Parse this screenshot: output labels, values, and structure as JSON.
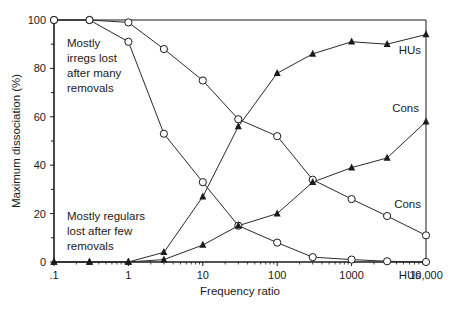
{
  "chart_data": {
    "type": "line",
    "title": "",
    "xlabel": "Frequency ratio",
    "ylabel": "Maximum dissociation (%)",
    "xscale": "log",
    "xlim": [
      0.1,
      10000
    ],
    "ylim": [
      0,
      100
    ],
    "grid": false,
    "x_ticks": [
      {
        "value": 0.1,
        "label": ".1"
      },
      {
        "value": 1,
        "label": "1"
      },
      {
        "value": 10,
        "label": "10"
      },
      {
        "value": 100,
        "label": "100"
      },
      {
        "value": 1000,
        "label": "1000"
      },
      {
        "value": 10000,
        "label": "10,000"
      }
    ],
    "y_ticks": [
      {
        "value": 0,
        "label": "0"
      },
      {
        "value": 20,
        "label": "20"
      },
      {
        "value": 40,
        "label": "40"
      },
      {
        "value": 60,
        "label": "60"
      },
      {
        "value": 80,
        "label": "80"
      },
      {
        "value": 100,
        "label": "100"
      }
    ],
    "x": [
      0.1,
      0.3,
      1,
      3,
      10,
      30,
      100,
      300,
      1000,
      3000,
      10000
    ],
    "series": [
      {
        "name": "Cons (irregs)",
        "marker": "circle",
        "label": "Cons",
        "label_pos": [
          405,
          208
        ],
        "values": [
          100,
          100,
          99,
          88,
          75,
          59,
          52,
          34,
          26,
          19,
          11
        ]
      },
      {
        "name": "HUs (irregs)",
        "marker": "circle",
        "label": "HUs",
        "label_pos": [
          405,
          279
        ],
        "values": [
          100,
          100,
          91,
          53,
          33,
          15,
          8,
          2,
          1,
          0.3,
          0
        ]
      },
      {
        "name": "HUs (regulars)",
        "marker": "triangle",
        "label": "HUs",
        "label_pos": [
          405,
          54
        ],
        "values": [
          0,
          0,
          0,
          4,
          27,
          56,
          78,
          86,
          91,
          90,
          94
        ]
      },
      {
        "name": "Cons (regulars)",
        "marker": "triangle",
        "label": "Cons",
        "label_pos": [
          403,
          112
        ],
        "values": [
          0,
          0,
          0,
          1,
          7,
          15,
          20,
          33,
          39,
          43,
          58
        ]
      }
    ],
    "annotations": [
      {
        "lines": [
          "Mostly",
          "irregs lost",
          "after many",
          "removals"
        ],
        "x": 67,
        "y": 47
      },
      {
        "lines": [
          "Mostly regulars",
          "lost after few",
          "removals"
        ],
        "x": 67,
        "y": 220
      }
    ]
  }
}
